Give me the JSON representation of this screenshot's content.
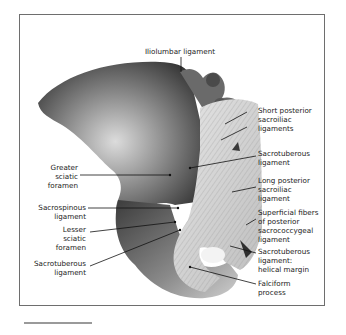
{
  "figure": {
    "colors": {
      "frame": "#6e6e6e",
      "text": "#1a1a1a",
      "leader": "#111111",
      "bone_dark": "#3a3a3a",
      "bone_light": "#d8d8d8"
    }
  },
  "labels": {
    "iliolumbar": "Iliolumbar ligament",
    "short_posterior_si": "Short posterior\nsacroiliac\nligaments",
    "sacrotuberous_upper": "Sacrotuberous\nligament",
    "long_posterior_si": "Long posterior\nsacroiliac\nligament",
    "superficial_fibers": "Superficial fibers\nof posterior\nsacrococcygeal\nligament",
    "sacrotuberous_helical": "Sacrotuberous\nligament:\nhelical margin",
    "falciform": "Falciform\nprocess",
    "greater_sciatic": "Greater\nsciatic\nforamen",
    "sacrospinous": "Sacrospinous\nligament",
    "lesser_sciatic": "Lesser\nsciatic\nforamen",
    "sacrotuberous_lower": "Sacrotuberous\nligament"
  }
}
